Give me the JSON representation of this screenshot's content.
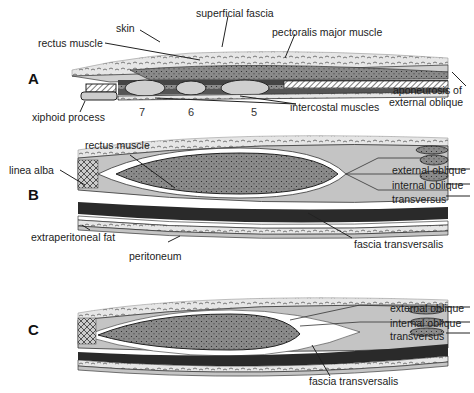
{
  "figure": {
    "panels": [
      {
        "letter": "A",
        "labels": {
          "skin": "skin",
          "superficial_fascia": "superficial fascia",
          "rectus_muscle": "rectus muscle",
          "pectoralis_major": "pectoralis major muscle",
          "aponeurosis_line1": "aponeurosis of",
          "aponeurosis_line2": "external oblique",
          "xiphoid_process": "xiphoid process",
          "intercostal_muscles": "intercostal muscles"
        },
        "rib_numbers": [
          "7",
          "6",
          "5"
        ]
      },
      {
        "letter": "B",
        "labels": {
          "rectus_muscle": "rectus muscle",
          "linea_alba": "linea alba",
          "external_oblique": "external oblique",
          "internal_oblique": "internal oblique",
          "transversus": "transversus",
          "extraperitoneal_fat": "extraperitoneal fat",
          "fascia_transversalis": "fascia transversalis",
          "peritoneum": "peritoneum"
        }
      },
      {
        "letter": "C",
        "labels": {
          "external_oblique": "external oblique",
          "internal_oblique": "internal oblique",
          "transversus": "transversus",
          "fascia_transversalis": "fascia transversalis"
        }
      }
    ],
    "colors": {
      "muscle_fill": "#8a8a8a",
      "sheath_fill": "#c4c4c4",
      "skin_fill": "#e2e2e2",
      "dark_band": "#2a2a2a",
      "outline": "#222222"
    }
  }
}
